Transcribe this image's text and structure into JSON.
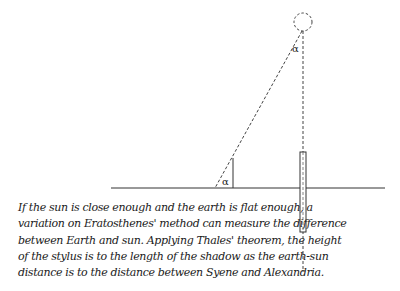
{
  "diagram": {
    "type": "geometric-illustration",
    "labels": {
      "angle_top": "α",
      "angle_bottom": "α"
    },
    "elements": {
      "sun": {
        "cx": 303,
        "cy": 22,
        "r": 9,
        "style": "dashed-circle"
      },
      "ground_line": {
        "x1": 111,
        "x2": 385,
        "y": 188
      },
      "stylus": {
        "x": 233,
        "y_top": 158,
        "y_bottom": 188
      },
      "shadow_ray": {
        "from": [
          303,
          31
        ],
        "to": [
          215,
          188
        ],
        "style": "dashed"
      },
      "vertical_ray": {
        "x": 303,
        "y_top": 31,
        "y_bottom": 272,
        "style": "dashed"
      },
      "well_rect": {
        "x": 300,
        "y": 152,
        "w": 6,
        "h": 80
      }
    },
    "colors": {
      "stroke": "#333333",
      "background": "#ffffff"
    }
  },
  "caption": {
    "lines": [
      "If the sun is close enough and the earth is flat enough, a",
      "variation on Eratosthenes' method can measure the difference",
      "between Earth and sun. Applying Thales' theorem, the height",
      "of the stylus is to the length of the shadow as the earth-sun",
      "distance is to the distance between Syene and Alexandria."
    ]
  }
}
